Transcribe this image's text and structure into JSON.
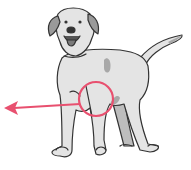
{
  "image": {
    "subject": "dog illustration",
    "description": "Standing light-gray dog with a pink circle highlighting the front leg/elbow area and a pink arrow pointing left",
    "colors": {
      "background": "#ffffff",
      "body": "#e4e4e4",
      "shadow": "#a8a8a8",
      "ears": "#9a9a9a",
      "outline": "#333333",
      "highlight": "#e8506f"
    }
  }
}
